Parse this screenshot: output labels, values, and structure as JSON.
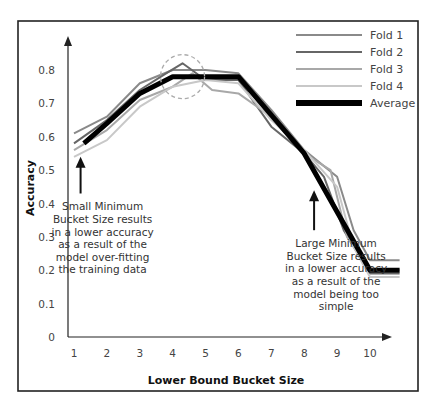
{
  "chart_data": {
    "type": "line",
    "title": "",
    "xlabel": "Lower Bound Bucket Size",
    "ylabel": "Accuracy",
    "xlim": [
      1,
      11
    ],
    "ylim": [
      0,
      0.85
    ],
    "x_ticks": [
      1,
      2,
      3,
      4,
      5,
      6,
      7,
      8,
      9,
      10
    ],
    "y_ticks": [
      0,
      0.1,
      0.2,
      0.3,
      0.4,
      0.5,
      0.6,
      0.7,
      0.8
    ],
    "grid": false,
    "legend_position": "top-right",
    "series": [
      {
        "name": "Fold 1",
        "color": "#8a8a8a",
        "width": 2,
        "points": [
          [
            1.0,
            0.61
          ],
          [
            2.0,
            0.66
          ],
          [
            3.0,
            0.76
          ],
          [
            4.0,
            0.8
          ],
          [
            5.0,
            0.8
          ],
          [
            6.0,
            0.79
          ],
          [
            7.0,
            0.68
          ],
          [
            8.0,
            0.56
          ],
          [
            9.0,
            0.48
          ],
          [
            9.5,
            0.32
          ],
          [
            10.0,
            0.23
          ],
          [
            10.9,
            0.23
          ]
        ]
      },
      {
        "name": "Fold 2",
        "color": "#666666",
        "width": 2,
        "points": [
          [
            1.0,
            0.58
          ],
          [
            2.0,
            0.65
          ],
          [
            3.0,
            0.74
          ],
          [
            3.8,
            0.79
          ],
          [
            4.3,
            0.82
          ],
          [
            5.0,
            0.77
          ],
          [
            6.0,
            0.77
          ],
          [
            7.0,
            0.63
          ],
          [
            8.0,
            0.55
          ],
          [
            8.6,
            0.48
          ],
          [
            9.2,
            0.32
          ],
          [
            10.0,
            0.19
          ],
          [
            10.9,
            0.19
          ]
        ]
      },
      {
        "name": "Fold 3",
        "color": "#a8a8a8",
        "width": 2,
        "points": [
          [
            1.0,
            0.56
          ],
          [
            2.0,
            0.62
          ],
          [
            3.0,
            0.71
          ],
          [
            4.0,
            0.75
          ],
          [
            4.6,
            0.79
          ],
          [
            5.2,
            0.74
          ],
          [
            6.0,
            0.73
          ],
          [
            7.0,
            0.66
          ],
          [
            8.0,
            0.55
          ],
          [
            8.8,
            0.5
          ],
          [
            9.3,
            0.3
          ],
          [
            10.0,
            0.2
          ],
          [
            10.9,
            0.2
          ]
        ]
      },
      {
        "name": "Fold 4",
        "color": "#c8c8c8",
        "width": 2,
        "points": [
          [
            1.0,
            0.54
          ],
          [
            2.0,
            0.59
          ],
          [
            3.0,
            0.69
          ],
          [
            4.0,
            0.75
          ],
          [
            5.0,
            0.77
          ],
          [
            6.0,
            0.76
          ],
          [
            7.0,
            0.65
          ],
          [
            8.0,
            0.56
          ],
          [
            9.0,
            0.45
          ],
          [
            9.5,
            0.27
          ],
          [
            10.0,
            0.18
          ],
          [
            10.9,
            0.18
          ]
        ]
      },
      {
        "name": "Average",
        "color": "#000000",
        "width": 5,
        "points": [
          [
            1.3,
            0.58
          ],
          [
            2.0,
            0.64
          ],
          [
            3.0,
            0.73
          ],
          [
            4.0,
            0.78
          ],
          [
            6.0,
            0.78
          ],
          [
            8.0,
            0.55
          ],
          [
            10.0,
            0.2
          ],
          [
            10.9,
            0.2
          ]
        ]
      }
    ],
    "annotations": [
      {
        "type": "dashed-circle",
        "description": "highlight of peak accuracy",
        "center": [
          4.3,
          0.78
        ],
        "color": "#aaaaaa"
      },
      {
        "type": "arrow-text",
        "arrow_x": 1.2,
        "arrow_from_y": 0.43,
        "arrow_to_y": 0.54,
        "lines": [
          "Small Minimum",
          "Bucket Size results",
          "in a lower accuracy",
          "as a result of the",
          "model over-fitting",
          "the training data"
        ]
      },
      {
        "type": "arrow-text",
        "arrow_x": 8.3,
        "arrow_from_y": 0.32,
        "arrow_to_y": 0.44,
        "lines": [
          "Large Minimum",
          "Bucket Size results",
          "in a lower accuracy",
          "as a result of the",
          "model being too",
          "simple"
        ]
      }
    ]
  }
}
